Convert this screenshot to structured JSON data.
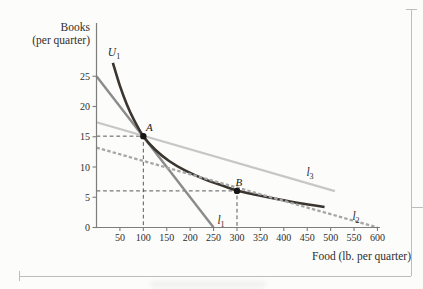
{
  "axis_titles": {
    "y_line1": "Books",
    "y_line2": "(per quarter)",
    "x": "Food (lb. per quarter)"
  },
  "chart_data": {
    "type": "line",
    "title": "",
    "xlabel": "Food (lb. per quarter)",
    "ylabel": "Books (per quarter)",
    "xlim": [
      0,
      620
    ],
    "ylim": [
      0,
      30
    ],
    "grid": false,
    "legend": "none",
    "x_ticks": [
      50,
      100,
      150,
      200,
      250,
      300,
      350,
      400,
      450,
      500,
      550,
      600
    ],
    "y_ticks": [
      0,
      5,
      10,
      15,
      20,
      25
    ],
    "axis_color": "#7d7d7d",
    "tick_label_color": "#2f2f2f",
    "guide_color": "#585858",
    "point_color": "#151515",
    "series": [
      {
        "name": "l3",
        "label_main": "l",
        "label_sub": "3",
        "role": "budget-line-laspeyres",
        "style": "solid",
        "color": "#c7c7c7",
        "width": 2.3,
        "smooth": false,
        "points": [
          [
            0,
            17.4
          ],
          [
            509,
            6.0
          ]
        ]
      },
      {
        "name": "l1",
        "label_main": "l",
        "label_sub": "1",
        "role": "budget-line-base-year",
        "style": "solid",
        "color": "#8b8b8b",
        "width": 2.4,
        "smooth": false,
        "points": [
          [
            0,
            25
          ],
          [
            250,
            0
          ]
        ]
      },
      {
        "name": "U1",
        "label_main": "U",
        "label_sub": "1",
        "role": "indifference-curve",
        "style": "solid",
        "color": "#3a362f",
        "width": 2.6,
        "smooth": true,
        "points": [
          [
            35,
            27.2
          ],
          [
            50,
            23.4
          ],
          [
            65,
            20.3
          ],
          [
            80,
            17.8
          ],
          [
            100,
            15.1
          ],
          [
            125,
            12.9
          ],
          [
            155,
            11.0
          ],
          [
            190,
            9.4
          ],
          [
            230,
            8.0
          ],
          [
            270,
            6.9
          ],
          [
            300,
            6.1
          ],
          [
            340,
            5.4
          ],
          [
            385,
            4.7
          ],
          [
            435,
            4.0
          ],
          [
            487,
            3.4
          ]
        ]
      },
      {
        "name": "l2",
        "label_main": "l",
        "label_sub": "2",
        "role": "budget-line-current-year",
        "style": "dashed",
        "color": "#a6a6a6",
        "width": 2.3,
        "dash": "3.4 2.2",
        "smooth": false,
        "points": [
          [
            0,
            13.2
          ],
          [
            600,
            0
          ]
        ]
      }
    ],
    "points": [
      {
        "label": "A",
        "x": 100,
        "y": 15.1
      },
      {
        "label": "B",
        "x": 300,
        "y": 6.05
      }
    ],
    "guides": [
      {
        "x": 100,
        "y": 15.1
      },
      {
        "x": 300,
        "y": 6.05
      }
    ]
  },
  "labels": {
    "curve_labels": [
      {
        "text_main": "U",
        "text_sub": "1",
        "px": 114,
        "py": 52,
        "series": "U1"
      },
      {
        "text_main": "l",
        "text_sub": "1",
        "px": 221,
        "py": 220,
        "series": "l1"
      },
      {
        "text_main": "l",
        "text_sub": "2",
        "px": 356,
        "py": 216,
        "series": "l2"
      },
      {
        "text_main": "l",
        "text_sub": "3",
        "px": 310,
        "py": 172,
        "series": "l3"
      }
    ],
    "point_label_offsets": {
      "A": [
        6,
        -5.5
      ],
      "B": [
        2,
        -5
      ]
    }
  },
  "frame": {
    "rule_color": "#bdbdbd"
  }
}
